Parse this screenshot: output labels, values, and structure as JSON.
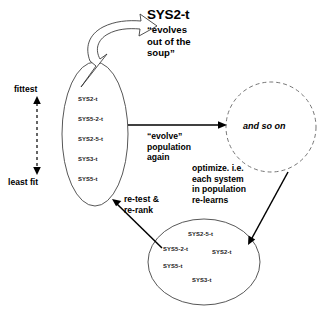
{
  "diagram": {
    "title": "SYS2-t",
    "title_caption": "“evolves\nout of the\nsoup”",
    "fitness_axis": {
      "top_label": "fittest",
      "bottom_label": "least fit"
    },
    "population_ellipse": {
      "name": "ranked-population",
      "items": [
        "SYS2-t",
        "SYS5-2-t",
        "SYS2-5-t",
        "SYS3-t",
        "SYS5-t"
      ]
    },
    "optimized_ellipse": {
      "name": "optimized-population",
      "items": [
        "SYS2-5-t",
        "SYS5-2-t",
        "SYS2-t",
        "SYS5-t",
        "SYS3-t"
      ]
    },
    "next_circle": {
      "label": "and so on"
    },
    "edges": {
      "evolve": "“evolve”\npopulation\nagain",
      "optimize": "optimize. i.e.\neach system\nin population\nre-learns",
      "retest": "re-test &\nre-rank"
    },
    "colors": {
      "stroke": "#333333",
      "text": "#000000",
      "background": "#ffffff"
    }
  }
}
